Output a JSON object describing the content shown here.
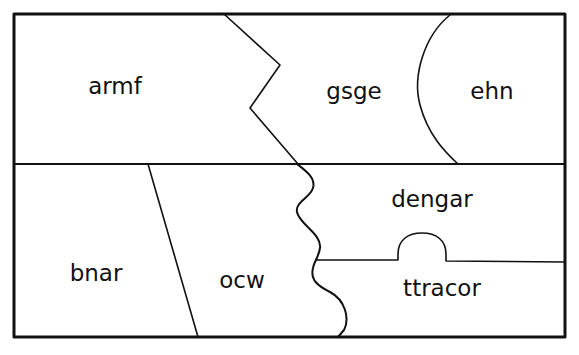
{
  "title_fragment": "",
  "colors": {
    "stroke": "#111111",
    "background": "#ffffff"
  },
  "regions": [
    {
      "id": "armf",
      "label": "armf",
      "x": 115,
      "y": 94
    },
    {
      "id": "gsge",
      "label": "gsge",
      "x": 354,
      "y": 99
    },
    {
      "id": "ehn",
      "label": "ehn",
      "x": 492,
      "y": 99
    },
    {
      "id": "bnar",
      "label": "bnar",
      "x": 96,
      "y": 281
    },
    {
      "id": "ocw",
      "label": "ocw",
      "x": 242,
      "y": 288
    },
    {
      "id": "dengar",
      "label": "dengar",
      "x": 432,
      "y": 207
    },
    {
      "id": "ttracor",
      "label": "ttracor",
      "x": 442,
      "y": 296
    }
  ]
}
